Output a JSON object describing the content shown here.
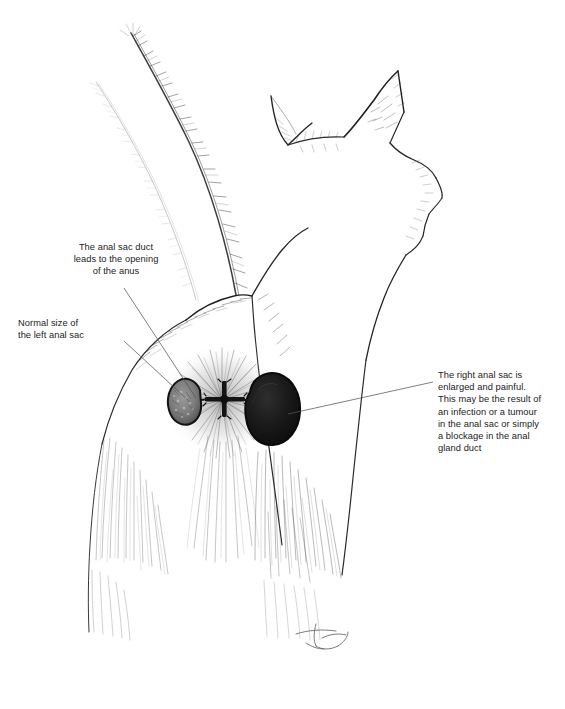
{
  "illustration": {
    "title": "Feline anal sac anatomy illustration",
    "subject": "cat viewed from behind with tail raised and head turned in profile",
    "medium": "pen and ink line drawing",
    "background_color": "#ffffff",
    "ink_color": "#1b1b1b",
    "parts": [
      {
        "name": "tail",
        "description": "raised tail with fine hair strokes"
      },
      {
        "name": "head",
        "description": "cat head in profile with two pointed ears"
      },
      {
        "name": "rump",
        "description": "hindquarters with radiating fur"
      },
      {
        "name": "hind-legs",
        "description": "two hind legs with long vertical hair strokes"
      },
      {
        "name": "anus",
        "description": "dark cross shaped opening"
      },
      {
        "name": "left-anal-sac",
        "description": "normal sized sac, mottled grey interior",
        "fill": "#6e6e6e"
      },
      {
        "name": "right-anal-sac",
        "description": "enlarged sac, solid black",
        "fill": "#141414"
      },
      {
        "name": "signature",
        "description": "artist monogram"
      }
    ]
  },
  "annotations": {
    "duct": {
      "text": "The anal sac duct\nleads to the opening\nof the anus",
      "align": "center"
    },
    "left_sac": {
      "text": "Normal size of\nthe left anal sac",
      "align": "left"
    },
    "right_sac": {
      "text": "The right anal sac is\nenlarged and painful.\nThis may be the result of\nan infection or a tumour\nin the anal sac or simply\na blockage in the anal\ngland duct",
      "align": "left"
    }
  }
}
